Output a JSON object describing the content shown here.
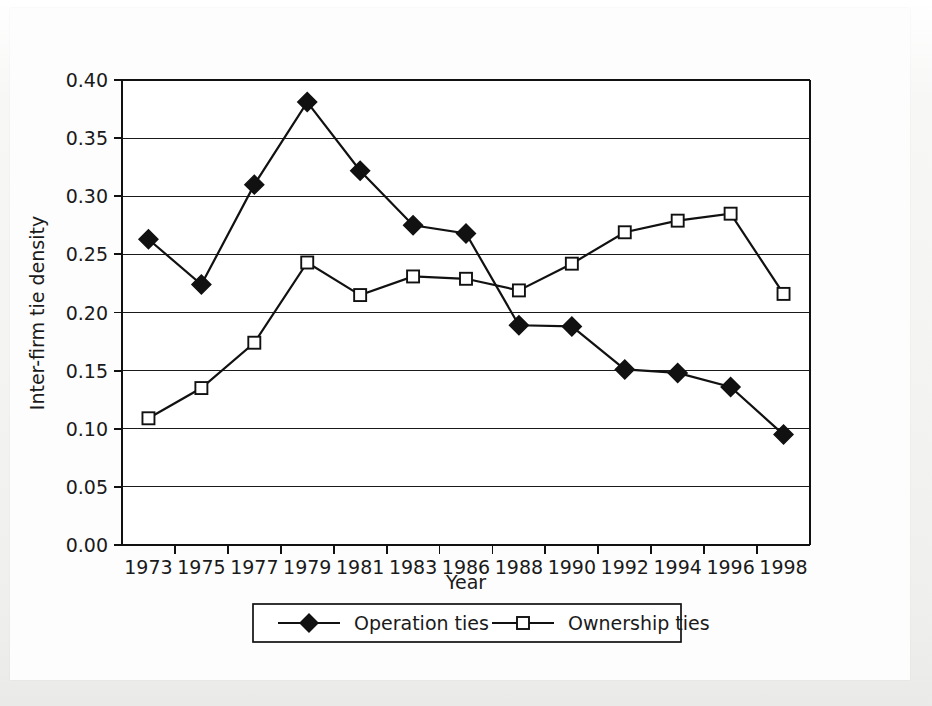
{
  "chart_data": {
    "type": "line",
    "title": "",
    "xlabel": "Year",
    "ylabel": "Inter-firm tie density",
    "categories": [
      "1973",
      "1975",
      "1977",
      "1979",
      "1981",
      "1983",
      "1986",
      "1988",
      "1990",
      "1992",
      "1994",
      "1996",
      "1998"
    ],
    "ylim": [
      0.0,
      0.4
    ],
    "ytick_labels": [
      "0.00",
      "0.05",
      "0.10",
      "0.15",
      "0.20",
      "0.25",
      "0.30",
      "0.35",
      "0.40"
    ],
    "ytick_values": [
      0.0,
      0.05,
      0.1,
      0.15,
      0.2,
      0.25,
      0.3,
      0.35,
      0.4
    ],
    "grid": true,
    "grid_axis": "y",
    "legend_position": "bottom",
    "series": [
      {
        "name": "Operation ties",
        "marker": "filled-diamond",
        "color": "#111111",
        "values": [
          0.263,
          0.224,
          0.31,
          0.381,
          0.322,
          0.275,
          0.268,
          0.189,
          0.188,
          0.151,
          0.148,
          0.136,
          0.095
        ]
      },
      {
        "name": "Ownership ties",
        "marker": "open-square",
        "color": "#111111",
        "values": [
          0.109,
          0.135,
          0.174,
          0.243,
          0.215,
          0.231,
          0.229,
          0.219,
          0.242,
          0.269,
          0.279,
          0.285,
          0.216
        ]
      }
    ]
  },
  "legend": {
    "items": [
      {
        "label": "Operation ties",
        "marker": "filled-diamond"
      },
      {
        "label": "Ownership ties",
        "marker": "open-square"
      }
    ]
  },
  "axes": {
    "x_title": "Year",
    "y_title": "Inter-firm tie density"
  },
  "colors": {
    "ink": "#111111",
    "plot_background": "#ffffff",
    "paper_background": "#f4f4f3"
  }
}
